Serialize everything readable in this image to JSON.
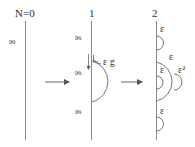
{
  "diagram": {
    "panels": [
      {
        "title": "N=0",
        "line_label": "g"
      },
      {
        "title": "1",
        "line_labels": [
          "g",
          "g",
          "g"
        ],
        "arc_label": "ε g"
      },
      {
        "title": "2",
        "arc_labels": [
          "ε",
          "ε",
          "ε",
          "ε²",
          "ε"
        ]
      }
    ],
    "arrows": [
      {
        "from": "N=0",
        "to": "1"
      },
      {
        "from": "1",
        "to": "2"
      }
    ],
    "colors": {
      "line": "#888888",
      "text": "#333333",
      "background": "#ffffff"
    }
  }
}
